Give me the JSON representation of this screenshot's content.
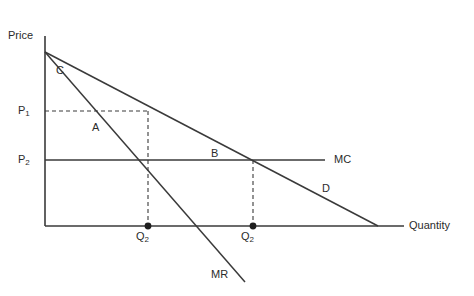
{
  "figure": {
    "type": "economics-diagram",
    "background_color": "#ffffff",
    "line_color": "#3a3a3a",
    "text_color": "#2b2b2b"
  },
  "axes": {
    "y_axis_label": "Price",
    "x_axis_label": "Quantity",
    "origin": {
      "x": 45,
      "y": 226
    },
    "y_top": {
      "x": 45,
      "y": 36
    },
    "x_right": {
      "x": 404,
      "y": 226
    }
  },
  "price_levels": [
    {
      "id": "p1",
      "label": "P",
      "subscript": "1",
      "y": 111,
      "label_x": 18,
      "label_y": 105
    },
    {
      "id": "p2",
      "label": "P",
      "subscript": "2",
      "y": 160,
      "label_x": 18,
      "label_y": 154
    }
  ],
  "quantity_ticks": [
    {
      "id": "q-left",
      "label": "Q",
      "subscript": "2",
      "x": 148,
      "label_x": 136,
      "label_y": 231
    },
    {
      "id": "q-right",
      "label": "Q",
      "subscript": "2",
      "x": 253,
      "label_x": 241,
      "label_y": 231
    }
  ],
  "curves": [
    {
      "id": "demand",
      "label": "D",
      "label_x": 322,
      "label_y": 183,
      "from": {
        "x": 45,
        "y": 52
      },
      "to": {
        "x": 378,
        "y": 226
      }
    },
    {
      "id": "marginal-revenue",
      "label": "MR",
      "label_x": 211,
      "label_y": 269,
      "from": {
        "x": 45,
        "y": 52
      },
      "to": {
        "x": 245,
        "y": 282
      }
    },
    {
      "id": "marginal-cost",
      "label": "MC",
      "label_x": 334,
      "label_y": 154,
      "from": {
        "x": 45,
        "y": 160
      },
      "to": {
        "x": 325,
        "y": 160
      }
    }
  ],
  "region_labels": [
    {
      "id": "region-c",
      "label": "C",
      "x": 56,
      "y": 65
    },
    {
      "id": "region-a",
      "label": "A",
      "x": 92,
      "y": 122
    },
    {
      "id": "region-b",
      "label": "B",
      "x": 211,
      "y": 148
    }
  ],
  "dashed_guides": [
    {
      "id": "p1-horizontal",
      "x1": 45,
      "y1": 111,
      "x2": 148,
      "y2": 111
    },
    {
      "id": "q-left-vertical",
      "x1": 148,
      "y1": 111,
      "x2": 148,
      "y2": 226
    },
    {
      "id": "q-right-vertical",
      "x1": 253,
      "y1": 160,
      "x2": 253,
      "y2": 226
    }
  ],
  "points": [
    {
      "id": "point-q-left",
      "x": 148,
      "y": 226
    },
    {
      "id": "point-q-right",
      "x": 253,
      "y": 226
    }
  ]
}
